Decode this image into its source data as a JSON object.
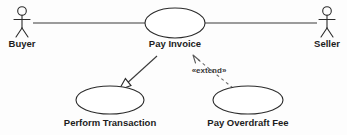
{
  "diagram": {
    "type": "uml-use-case-diagram",
    "title": "",
    "background_color": "#fdfdfd",
    "line_color": "#2b2b2b",
    "dashed_line_color": "#6b6b6b",
    "text_color": "#1c1c1c"
  },
  "actors": [
    {
      "id": "buyer",
      "label": "Buyer",
      "icon": "stick-figure-icon",
      "x": 22,
      "y": 22,
      "label_x": 22,
      "label_y": 47
    },
    {
      "id": "seller",
      "label": "Seller",
      "icon": "stick-figure-icon",
      "x": 327,
      "y": 22,
      "label_x": 327,
      "label_y": 47
    }
  ],
  "use_cases": [
    {
      "id": "pay-invoice",
      "label": "Pay Invoice",
      "cx": 175,
      "cy": 23,
      "rx": 30,
      "ry": 15,
      "label_x": 175,
      "label_y": 47
    },
    {
      "id": "perform-transaction",
      "label": "Perform Transaction",
      "cx": 110,
      "cy": 100,
      "rx": 34,
      "ry": 14,
      "label_x": 110,
      "label_y": 126
    },
    {
      "id": "pay-overdraft-fee",
      "label": "Pay Overdraft Fee",
      "cx": 248,
      "cy": 100,
      "rx": 35,
      "ry": 14,
      "label_x": 248,
      "label_y": 126
    }
  ],
  "associations": [
    {
      "id": "buyer-pay-invoice",
      "from": "buyer",
      "to": "pay-invoice",
      "style": "solid",
      "x1": 33,
      "y1": 23,
      "x2": 145,
      "y2": 23
    },
    {
      "id": "pay-invoice-seller",
      "from": "pay-invoice",
      "to": "seller",
      "style": "solid",
      "x1": 205,
      "y1": 23,
      "x2": 317,
      "y2": 23
    }
  ],
  "relationships": [
    {
      "id": "generalization-perform-transaction",
      "from": "pay-invoice",
      "to": "perform-transaction",
      "style": "solid",
      "arrowhead": "hollow-triangle",
      "label": "",
      "x1": 157,
      "y1": 56,
      "x2": 122,
      "y2": 88
    },
    {
      "id": "extend-pay-overdraft-fee",
      "from": "pay-overdraft-fee",
      "to": "pay-invoice",
      "style": "dashed",
      "arrowhead": "open-v",
      "label": "«extend»",
      "label_x": 209,
      "label_y": 73,
      "x1": 232,
      "y1": 87,
      "x2": 193,
      "y2": 55
    }
  ]
}
